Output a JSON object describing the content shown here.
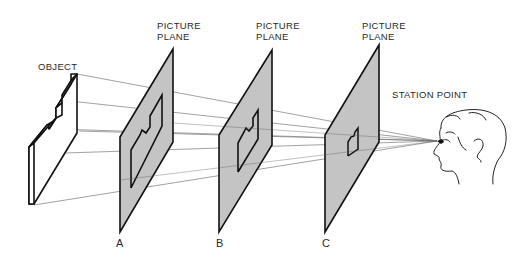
{
  "labels": {
    "object": "OBJECT",
    "station_point": "STATION POINT",
    "planes": [
      {
        "line1": "PICTURE",
        "line2": "PLANE",
        "letter": "A"
      },
      {
        "line1": "PICTURE",
        "line2": "PLANE",
        "letter": "B"
      },
      {
        "line1": "PICTURE",
        "line2": "PLANE",
        "letter": "C"
      }
    ]
  },
  "colors": {
    "plane_fill": "#c4c4c4",
    "line": "#111111",
    "ray": "#777777"
  }
}
